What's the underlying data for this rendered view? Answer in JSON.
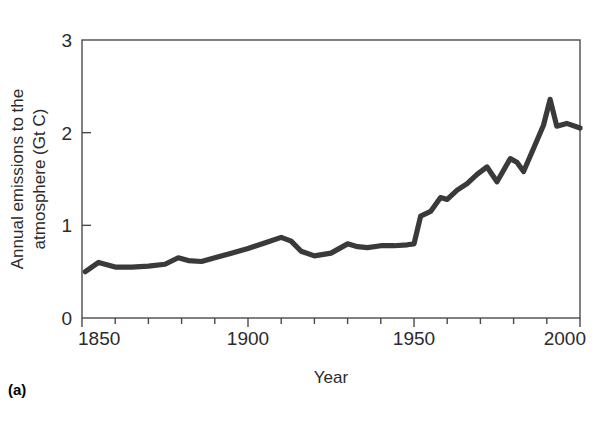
{
  "figure": {
    "panel_letter": "(a)",
    "background_color": "#ffffff",
    "line_color": "#3a3a3a",
    "axis_color": "#4a4a4a"
  },
  "chart_data": {
    "type": "line",
    "title": "",
    "xlabel": "Year",
    "ylabel": "Annual emissions to the atmosphere (Gt C)",
    "ylabel_line1": "Annual emissions to the",
    "ylabel_line2": "atmosphere (Gt C)",
    "xlim": [
      1850,
      2000
    ],
    "ylim": [
      0,
      3
    ],
    "xticks": [
      1850,
      1900,
      1950,
      2000
    ],
    "xtick_labels": [
      "1850",
      "1900",
      "1950",
      "2000"
    ],
    "xminor_step": 10,
    "yticks": [
      0,
      1,
      2,
      3
    ],
    "ytick_labels": [
      "0",
      "1",
      "2",
      "3"
    ],
    "grid": false,
    "legend": null,
    "series": [
      {
        "name": "Annual emissions to the atmosphere",
        "units": "Gt C",
        "x": [
          1851,
          1855,
          1860,
          1865,
          1870,
          1875,
          1879,
          1882,
          1886,
          1890,
          1895,
          1900,
          1905,
          1910,
          1913,
          1916,
          1920,
          1925,
          1930,
          1933,
          1936,
          1940,
          1944,
          1948,
          1950,
          1952,
          1955,
          1958,
          1960,
          1963,
          1966,
          1969,
          1972,
          1975,
          1979,
          1981,
          1983,
          1986,
          1989,
          1991,
          1993,
          1996,
          2000
        ],
        "y": [
          0.5,
          0.6,
          0.55,
          0.55,
          0.56,
          0.58,
          0.65,
          0.62,
          0.61,
          0.65,
          0.7,
          0.75,
          0.81,
          0.87,
          0.83,
          0.72,
          0.67,
          0.7,
          0.8,
          0.77,
          0.76,
          0.78,
          0.78,
          0.79,
          0.8,
          1.1,
          1.15,
          1.3,
          1.28,
          1.38,
          1.45,
          1.55,
          1.63,
          1.47,
          1.72,
          1.68,
          1.58,
          1.83,
          2.08,
          2.36,
          2.07,
          2.1,
          2.05
        ]
      }
    ]
  }
}
